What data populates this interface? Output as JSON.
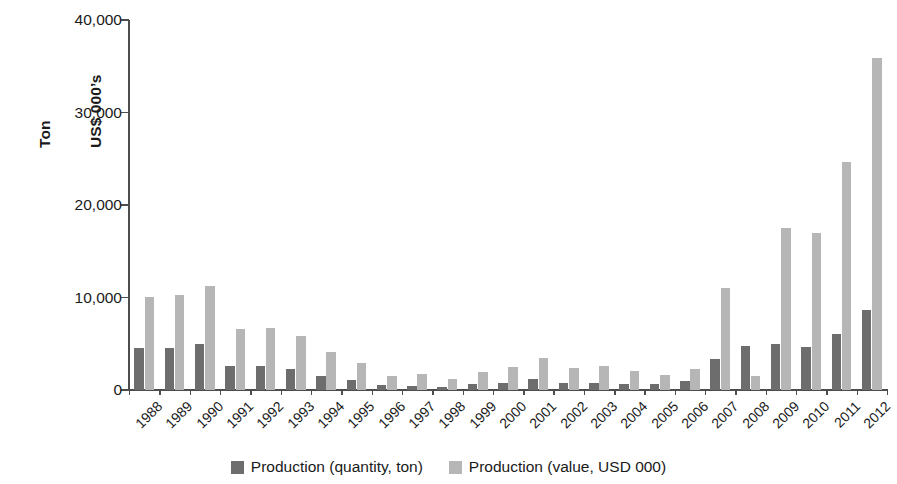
{
  "chart_data": {
    "type": "bar",
    "title": "",
    "subtitle": "",
    "xlabel": "",
    "ylabel": "Ton\nUS$ 000's",
    "ylabel_lines": [
      "Ton",
      "US$ 000’s"
    ],
    "ylim": [
      0,
      40000
    ],
    "ytick_labels": [
      "0",
      "10,000",
      "20,000",
      "30,000",
      "40,000"
    ],
    "ytick_values": [
      0,
      10000,
      20000,
      30000,
      40000
    ],
    "grid": false,
    "legend_position": "bottom-center",
    "categories": [
      "1988",
      "1989",
      "1990",
      "1991",
      "1992",
      "1993",
      "1994",
      "1995",
      "1996",
      "1997",
      "1998",
      "1999",
      "2000",
      "2001",
      "2002",
      "2003",
      "2004",
      "2005",
      "2006",
      "2007",
      "2008",
      "2009",
      "2010",
      "2011",
      "2012"
    ],
    "series": [
      {
        "name": "Production (quantity, ton)",
        "color": "#6d6d6d",
        "values": [
          4500,
          4550,
          5000,
          2650,
          2600,
          2300,
          1500,
          1050,
          500,
          450,
          300,
          700,
          800,
          1150,
          800,
          800,
          600,
          700,
          950,
          3400,
          4800,
          4950,
          4700,
          6050,
          8700
        ]
      },
      {
        "name": "Production (value, USD 000)",
        "color": "#b6b6b6",
        "values": [
          10100,
          10250,
          11200,
          6600,
          6700,
          5800,
          4100,
          2950,
          1500,
          1700,
          1150,
          1900,
          2450,
          3450,
          2400,
          2550,
          2100,
          1650,
          2300,
          11050,
          1500,
          17550,
          17000,
          24650,
          35900
        ]
      }
    ]
  },
  "legend": {
    "items": [
      {
        "label": "Production (quantity, ton)",
        "swatch": "q"
      },
      {
        "label": "Production (value, USD 000)",
        "swatch": "v"
      }
    ]
  }
}
